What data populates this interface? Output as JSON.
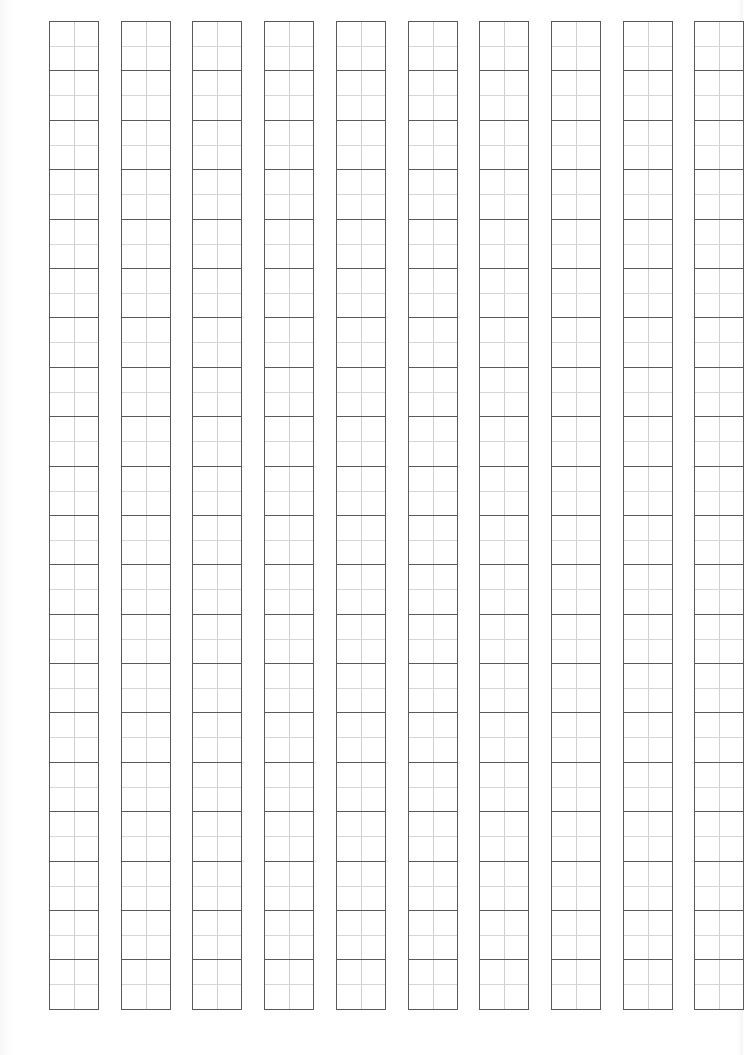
{
  "sheet": {
    "type": "tianzige-practice-grid",
    "columns": 10,
    "rows_per_column": 20,
    "column_width_px": 49,
    "column_step_px": 71.7,
    "first_column_left_px": 49,
    "grid_top_px": 21,
    "grid_bottom_px": 1009,
    "cell_guides": "quarter lines (vertical + horizontal center)",
    "colors": {
      "paper": "#ffffff",
      "cell_border": "#5a5a5a",
      "guide_line": "#cfcfcf"
    },
    "text_content": []
  }
}
